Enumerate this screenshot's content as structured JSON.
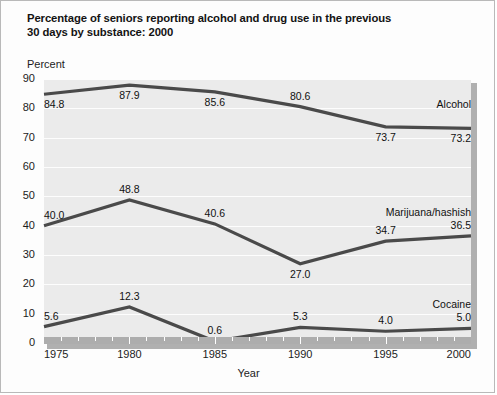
{
  "title": {
    "line1": "Percentage of seniors reporting alcohol and drug use in the previous",
    "line2": "30 days by substance: 2000"
  },
  "axis": {
    "y_title": "Percent",
    "x_title": "Year"
  },
  "chart_data": {
    "type": "line",
    "title": "Percentage of seniors reporting alcohol and drug use in the previous 30 days by substance: 2000",
    "xlabel": "Year",
    "ylabel": "Percent",
    "x": [
      1975,
      1980,
      1985,
      1990,
      1995,
      2000
    ],
    "xtick_labels": [
      "1975",
      "1980",
      "1985",
      "1990",
      "1995",
      "2000"
    ],
    "xlim": [
      1975,
      2000
    ],
    "ylim": [
      0,
      90
    ],
    "ytick_labels": [
      "0",
      "10",
      "20",
      "30",
      "40",
      "50",
      "60",
      "70",
      "80",
      "90"
    ],
    "yticks": [
      0,
      10,
      20,
      30,
      40,
      50,
      60,
      70,
      80,
      90
    ],
    "minor_x_ticks": 1,
    "grid": "horizontal",
    "legend_position": "right-inline",
    "line_color": "#4a4a4a",
    "plot_background": "#ebebeb",
    "series": [
      {
        "name": "Alcohol",
        "values": [
          84.8,
          87.9,
          85.6,
          80.6,
          73.7,
          73.2
        ],
        "value_labels": [
          "84.8",
          "87.9",
          "85.6",
          "80.6",
          "73.7",
          "73.2"
        ]
      },
      {
        "name": "Marijuana/hashish",
        "values": [
          40.0,
          48.8,
          40.6,
          27.0,
          34.7,
          36.5
        ],
        "value_labels": [
          "40.0",
          "48.8",
          "40.6",
          "27.0",
          "34.7",
          "36.5"
        ]
      },
      {
        "name": "Cocaine",
        "values": [
          5.6,
          12.3,
          0.6,
          5.3,
          4.0,
          5.0
        ],
        "value_labels": [
          "5.6",
          "12.3",
          "0.6",
          "5.3",
          "4.0",
          "5.0"
        ]
      }
    ]
  }
}
